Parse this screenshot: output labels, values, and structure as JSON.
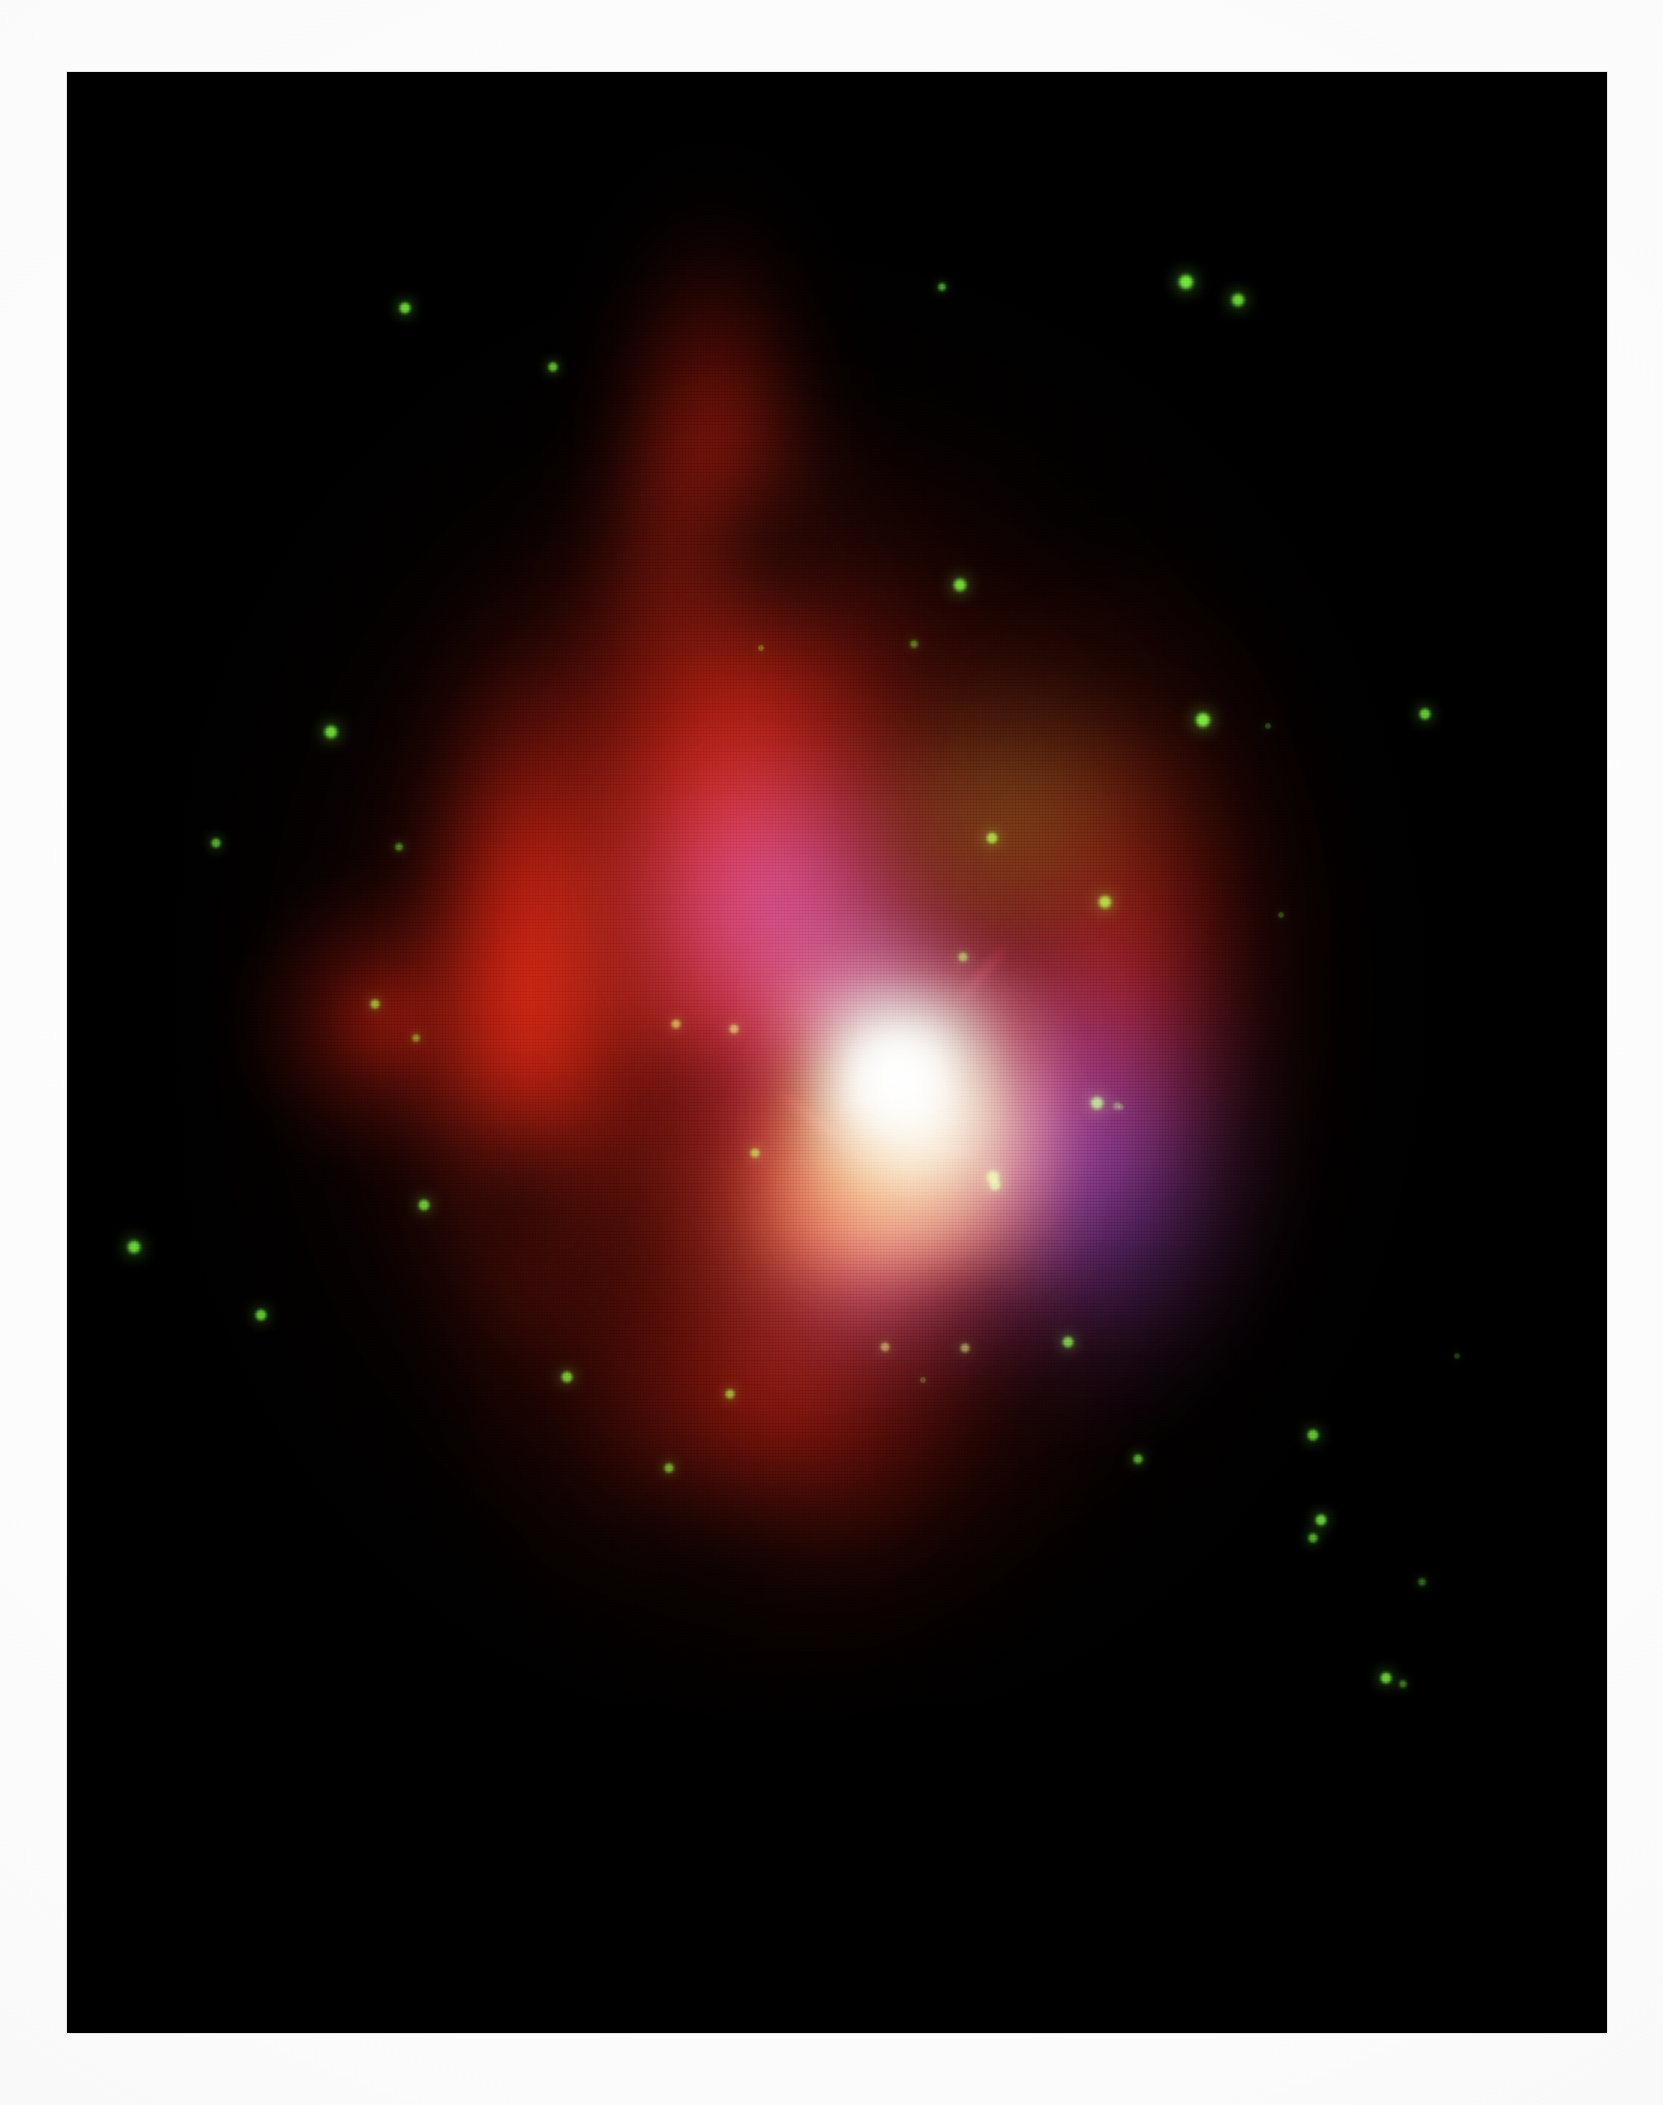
{
  "document": {
    "kind": "printed-photograph",
    "page_background": "#fdfdfd",
    "plate": {
      "background": "#000000",
      "x": 67,
      "y": 72,
      "width": 1540,
      "height": 1961
    }
  },
  "subject": {
    "name": "multiwavelength-composite-nebula",
    "description": "Composite false-colour astronomical image of a diffuse nebula / galaxy with a bright cyan-white nucleus, orange inner mantle, violet inner shells and an extended red halo with an upward plume, set against a black sky scattered with green point sources."
  },
  "palette": {
    "sky": "#000000",
    "paper": "#fdfdfd",
    "halo_red": "#96180c",
    "bright_red": "#d62210",
    "deep_red": "#700f07",
    "orange": "#ec7a1e",
    "peach": "#fab280",
    "violet": "#6048ba",
    "indigo": "#4e30a0",
    "magenta": "#c42c6e",
    "olive": "#7a6822",
    "core_cyan": "#c2f0ee",
    "core_white": "#ffffff",
    "core_cream": "#fff6d6",
    "star_green": "#66dd33",
    "filament_crimson": "#e22646"
  },
  "regions": [
    {
      "name": "red-halo-outer",
      "label": "extended red halo",
      "color": "#96180c"
    },
    {
      "name": "red-plume",
      "label": "northern red plume",
      "color": "#c41e0e"
    },
    {
      "name": "red-west-wall",
      "label": "bright western red wall",
      "color": "#d62210"
    },
    {
      "name": "red-east-lobe",
      "label": "eastern red lobe",
      "color": "#9e160b"
    },
    {
      "name": "red-south-skirt",
      "label": "southern red skirt",
      "color": "#96160b"
    },
    {
      "name": "olive-haze",
      "label": "olive haze north-east of core",
      "color": "#7a6822"
    },
    {
      "name": "violet-nw-arc",
      "label": "violet north-west inner arc",
      "color": "#6048ba"
    },
    {
      "name": "violet-se-arc",
      "label": "violet south-east inner arc",
      "color": "#6842be"
    },
    {
      "name": "magenta-ring",
      "label": "magenta transition ring",
      "color": "#c42c6e"
    },
    {
      "name": "orange-mantle",
      "label": "orange inner mantle",
      "color": "#ec7a1e"
    },
    {
      "name": "peach-glow",
      "label": "peach inner glow",
      "color": "#fab280"
    },
    {
      "name": "cyan-white-core",
      "label": "bright cyan-white nucleus",
      "color": "#eefffc"
    },
    {
      "name": "blue-lobe",
      "label": "pale blue lobe north of nucleus",
      "color": "#8cb0e2"
    }
  ],
  "filaments": [
    {
      "name": "filament-a",
      "color": "#e22646"
    },
    {
      "name": "filament-b",
      "color": "#d8223e"
    },
    {
      "name": "filament-c",
      "color": "#d01e3a"
    },
    {
      "name": "filament-d",
      "color": "#d6284e"
    }
  ],
  "stars": [
    {
      "x": 338,
      "y": 236,
      "r": 7,
      "c": "#6ddc36",
      "i": 0.95
    },
    {
      "x": 875,
      "y": 215,
      "r": 5,
      "c": "#64d432",
      "i": 0.75
    },
    {
      "x": 1119,
      "y": 210,
      "r": 9,
      "c": "#74e63c",
      "i": 1.0
    },
    {
      "x": 1171,
      "y": 228,
      "r": 8,
      "c": "#6fe038",
      "i": 0.95
    },
    {
      "x": 486,
      "y": 295,
      "r": 6,
      "c": "#6ad834",
      "i": 0.85
    },
    {
      "x": 893,
      "y": 513,
      "r": 8,
      "c": "#72e23a",
      "i": 0.95
    },
    {
      "x": 847,
      "y": 572,
      "r": 5,
      "c": "#5ec62c",
      "i": 0.6
    },
    {
      "x": 694,
      "y": 576,
      "r": 4,
      "c": "#55b828",
      "i": 0.45
    },
    {
      "x": 1136,
      "y": 648,
      "r": 9,
      "c": "#74e63c",
      "i": 1.0
    },
    {
      "x": 1201,
      "y": 654,
      "r": 4,
      "c": "#4fae24",
      "i": 0.4
    },
    {
      "x": 264,
      "y": 660,
      "r": 8,
      "c": "#6fe038",
      "i": 0.95
    },
    {
      "x": 149,
      "y": 771,
      "r": 6,
      "c": "#66d832",
      "i": 0.8
    },
    {
      "x": 332,
      "y": 775,
      "r": 5,
      "c": "#5cc82c",
      "i": 0.65
    },
    {
      "x": 925,
      "y": 766,
      "r": 7,
      "c": "#6ddc36",
      "i": 0.9
    },
    {
      "x": 1358,
      "y": 642,
      "r": 7,
      "c": "#6ddc36",
      "i": 0.9
    },
    {
      "x": 1038,
      "y": 830,
      "r": 8,
      "c": "#70e038",
      "i": 0.95
    },
    {
      "x": 1214,
      "y": 843,
      "r": 4,
      "c": "#4fae24",
      "i": 0.4
    },
    {
      "x": 896,
      "y": 885,
      "r": 6,
      "c": "#62d030",
      "i": 0.75
    },
    {
      "x": 308,
      "y": 932,
      "r": 6,
      "c": "#64d432",
      "i": 0.8
    },
    {
      "x": 349,
      "y": 966,
      "r": 5,
      "c": "#5cc82c",
      "i": 0.65
    },
    {
      "x": 609,
      "y": 952,
      "r": 6,
      "c": "#a8d84e",
      "i": 0.7
    },
    {
      "x": 667,
      "y": 957,
      "r": 6,
      "c": "#a8d84e",
      "i": 0.7
    },
    {
      "x": 818,
      "y": 1275,
      "r": 6,
      "c": "#c8d860",
      "i": 0.62
    },
    {
      "x": 898,
      "y": 1276,
      "r": 6,
      "c": "#c8d860",
      "i": 0.62
    },
    {
      "x": 1246,
      "y": 1363,
      "r": 7,
      "c": "#6ddc36",
      "i": 0.88
    },
    {
      "x": 1254,
      "y": 1448,
      "r": 7,
      "c": "#6fe038",
      "i": 0.9
    },
    {
      "x": 1246,
      "y": 1466,
      "r": 6,
      "c": "#64d432",
      "i": 0.8
    },
    {
      "x": 1030,
      "y": 1031,
      "r": 8,
      "c": "#70e038",
      "i": 0.95
    },
    {
      "x": 928,
      "y": 1113,
      "r": 7,
      "c": "#6ddc36",
      "i": 0.88
    },
    {
      "x": 688,
      "y": 1081,
      "r": 6,
      "c": "#64d432",
      "i": 0.78
    },
    {
      "x": 1050,
      "y": 1034,
      "r": 5,
      "c": "#58c02a",
      "i": 0.55
    },
    {
      "x": 357,
      "y": 1133,
      "r": 7,
      "c": "#6ddc36",
      "i": 0.88
    },
    {
      "x": 67,
      "y": 1175,
      "r": 8,
      "c": "#70e038",
      "i": 0.95
    },
    {
      "x": 1054,
      "y": 1035,
      "r": 4,
      "c": "#4fae24",
      "i": 0.35
    },
    {
      "x": 194,
      "y": 1243,
      "r": 7,
      "c": "#6ddc36",
      "i": 0.88
    },
    {
      "x": 1001,
      "y": 1270,
      "r": 7,
      "c": "#6ddc36",
      "i": 0.88
    },
    {
      "x": 1319,
      "y": 1606,
      "r": 7,
      "c": "#6fe038",
      "i": 0.9
    },
    {
      "x": 1336,
      "y": 1612,
      "r": 5,
      "c": "#5cc82c",
      "i": 0.6
    },
    {
      "x": 500,
      "y": 1305,
      "r": 7,
      "c": "#6ddc36",
      "i": 0.88
    },
    {
      "x": 663,
      "y": 1322,
      "r": 6,
      "c": "#64d432",
      "i": 0.8
    },
    {
      "x": 856,
      "y": 1308,
      "r": 4,
      "c": "#4fae24",
      "i": 0.4
    },
    {
      "x": 602,
      "y": 1396,
      "r": 6,
      "c": "#64d432",
      "i": 0.8
    },
    {
      "x": 1071,
      "y": 1387,
      "r": 6,
      "c": "#64d432",
      "i": 0.8
    },
    {
      "x": 926,
      "y": 1105,
      "r": 8,
      "c": "#72e23a",
      "i": 0.95
    },
    {
      "x": 1355,
      "y": 1510,
      "r": 5,
      "c": "#58c02a",
      "i": 0.55
    },
    {
      "x": 1390,
      "y": 1284,
      "r": 4,
      "c": "#4aa822",
      "i": 0.35
    }
  ],
  "star_marker": {
    "name": "green-point-source",
    "label": "green point source"
  }
}
